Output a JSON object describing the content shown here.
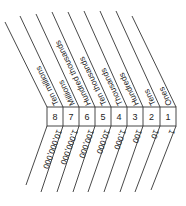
{
  "diagram": {
    "places": [
      {
        "digit": "8",
        "name": "Ten millions",
        "value": "10,000,000"
      },
      {
        "digit": "7",
        "name": "Millions",
        "value": "1,000,000"
      },
      {
        "digit": "6",
        "name": "Hundred thousands",
        "value": "100,000"
      },
      {
        "digit": "5",
        "name": "Ten thousands",
        "value": "10,000"
      },
      {
        "digit": "4",
        "name": "Thousands",
        "value": "1,000"
      },
      {
        "digit": "3",
        "name": "Hundreds",
        "value": "100"
      },
      {
        "digit": "2",
        "name": "Tens",
        "value": "10"
      },
      {
        "digit": "1",
        "name": "Ones",
        "value": "1"
      }
    ],
    "colors": {
      "line": "#333333",
      "text": "#222222",
      "background": "#ffffff"
    }
  }
}
